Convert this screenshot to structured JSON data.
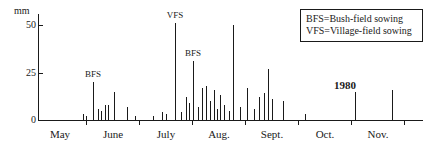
{
  "chart_data": {
    "type": "bar",
    "title": "",
    "subtitle": "",
    "xlabel": "",
    "ylabel": "mm",
    "ylim": [
      0,
      55
    ],
    "yticks": [
      0,
      25,
      50
    ],
    "ytick_labels": [
      "0",
      "25",
      "50"
    ],
    "grid": false,
    "legend_position": "top-right",
    "x_categories": [
      "May",
      "June",
      "July",
      "Aug.",
      "Sept.",
      "Oct.",
      "Nov."
    ],
    "x_axis_note": "Daily rainfall, one vertical line per rain day; month labels centred between ticks",
    "series": [
      {
        "name": "Daily rainfall (mm)",
        "points": [
          {
            "day": "late May 1",
            "x": 83,
            "value": 3
          },
          {
            "day": "late May 2",
            "x": 86,
            "value": 2
          },
          {
            "day": "June 1",
            "x": 93,
            "value": 20
          },
          {
            "day": "June 2",
            "x": 98,
            "value": 6
          },
          {
            "day": "June 3",
            "x": 101,
            "value": 5
          },
          {
            "day": "June 4",
            "x": 105,
            "value": 8
          },
          {
            "day": "June 5",
            "x": 108,
            "value": 8
          },
          {
            "day": "June 6",
            "x": 114,
            "value": 15
          },
          {
            "day": "June 7",
            "x": 127,
            "value": 7
          },
          {
            "day": "June 8",
            "x": 135,
            "value": 2
          },
          {
            "day": "July 1",
            "x": 153,
            "value": 2
          },
          {
            "day": "July 2",
            "x": 162,
            "value": 4
          },
          {
            "day": "July 3",
            "x": 166,
            "value": 3
          },
          {
            "day": "VFS day",
            "x": 175,
            "value": 51
          },
          {
            "day": "July 5",
            "x": 181,
            "value": 4
          },
          {
            "day": "July 6",
            "x": 186,
            "value": 12
          },
          {
            "day": "July 7",
            "x": 189,
            "value": 9
          },
          {
            "day": "BFS day",
            "x": 193,
            "value": 31
          },
          {
            "day": "July 9",
            "x": 198,
            "value": 7
          },
          {
            "day": "Aug 1",
            "x": 202,
            "value": 17
          },
          {
            "day": "Aug 2",
            "x": 206,
            "value": 18
          },
          {
            "day": "Aug 3",
            "x": 210,
            "value": 10
          },
          {
            "day": "Aug 4",
            "x": 214,
            "value": 16
          },
          {
            "day": "Aug 5",
            "x": 217,
            "value": 6
          },
          {
            "day": "Aug 6",
            "x": 220,
            "value": 13
          },
          {
            "day": "Aug 7",
            "x": 224,
            "value": 8
          },
          {
            "day": "Aug 8",
            "x": 229,
            "value": 5
          },
          {
            "day": "Aug 9",
            "x": 233,
            "value": 50
          },
          {
            "day": "Aug 10",
            "x": 240,
            "value": 7
          },
          {
            "day": "Aug 11",
            "x": 247,
            "value": 17
          },
          {
            "day": "Aug 12",
            "x": 254,
            "value": 6
          },
          {
            "day": "Aug 13",
            "x": 259,
            "value": 12
          },
          {
            "day": "Aug 14",
            "x": 264,
            "value": 14
          },
          {
            "day": "Aug 15",
            "x": 268,
            "value": 27
          },
          {
            "day": "Aug 16",
            "x": 272,
            "value": 11
          },
          {
            "day": "Sept 1",
            "x": 283,
            "value": 10
          },
          {
            "day": "Sept 2",
            "x": 305,
            "value": 3
          },
          {
            "day": "Oct 1",
            "x": 355,
            "value": 15
          },
          {
            "day": "Nov 1",
            "x": 392,
            "value": 16
          }
        ]
      }
    ],
    "annotations": [
      {
        "label": "BFS",
        "x": 93,
        "value": 20,
        "meaning": "Bush-field sowing"
      },
      {
        "label": "VFS",
        "x": 175,
        "value": 51,
        "meaning": "Village-field sowing"
      },
      {
        "label": "BFS",
        "x": 193,
        "value": 31,
        "meaning": "Bush-field sowing"
      }
    ]
  },
  "axes": {
    "y_unit": "mm",
    "y_ticks": [
      {
        "label": "50",
        "value": 50
      },
      {
        "label": "25",
        "value": 25
      },
      {
        "label": "0",
        "value": 0
      }
    ],
    "x_months": [
      {
        "label": "May",
        "center": 60
      },
      {
        "label": "June",
        "center": 113
      },
      {
        "label": "July",
        "center": 166
      },
      {
        "label": "Aug.",
        "center": 219
      },
      {
        "label": "Sept.",
        "center": 272
      },
      {
        "label": "Oct.",
        "center": 325
      },
      {
        "label": "Nov.",
        "center": 378
      }
    ],
    "x_tick_positions": [
      86,
      139,
      192,
      245,
      298,
      351,
      404
    ]
  },
  "legend": {
    "line1": "BFS=Bush-field sowing",
    "line2": "VFS=Village-field sowing"
  },
  "year": {
    "label": "1980"
  },
  "colors": {
    "ink": "#1a1a1a",
    "background": "#ffffff"
  }
}
